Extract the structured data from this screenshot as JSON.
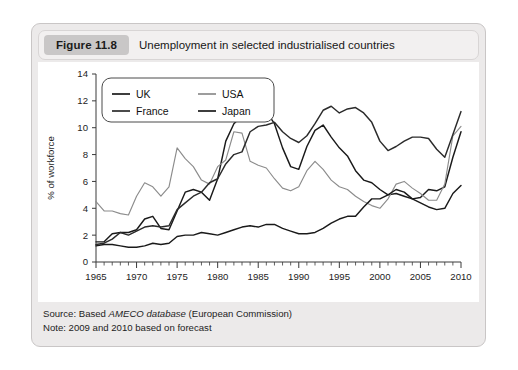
{
  "figure": {
    "badge": "Figure 11.8",
    "title": "Unemployment in selected industrialised countries"
  },
  "footer": {
    "source_prefix": "Source: Based ",
    "source_italic": "AMECO database",
    "source_suffix": " (European Commission)",
    "note": "Note: 2009 and 2010 based on forecast"
  },
  "colors": {
    "uk": "#1a1a1a",
    "usa": "#8c8c8c",
    "france": "#2b2b2b",
    "japan": "#1a1a1a",
    "axis": "#3a3a3a",
    "card_bg": "#eceaea",
    "plot_bg": "#ffffff",
    "badge_bg": "#c9c7c7"
  },
  "chart_data": {
    "type": "line",
    "title": "Unemployment in selected industrialised countries",
    "xlabel": "",
    "ylabel": "% of workforce",
    "xlim": [
      1965,
      2010
    ],
    "ylim": [
      0,
      14
    ],
    "ytick_step": 2,
    "xtick_step": 5,
    "minor_xticks": "annual",
    "grid": false,
    "legend_position": "top-left-inside",
    "yticks": [
      0,
      2,
      4,
      6,
      8,
      10,
      12,
      14
    ],
    "xticks": [
      1965,
      1970,
      1975,
      1980,
      1985,
      1990,
      1995,
      2000,
      2005,
      2010
    ],
    "x": [
      1965,
      1966,
      1967,
      1968,
      1969,
      1970,
      1971,
      1972,
      1973,
      1974,
      1975,
      1976,
      1977,
      1978,
      1979,
      1980,
      1981,
      1982,
      1983,
      1984,
      1985,
      1986,
      1987,
      1988,
      1989,
      1990,
      1991,
      1992,
      1993,
      1994,
      1995,
      1996,
      1997,
      1998,
      1999,
      2000,
      2001,
      2002,
      2003,
      2004,
      2005,
      2006,
      2007,
      2008,
      2009,
      2010
    ],
    "series": [
      {
        "name": "UK",
        "color": "#1a1a1a",
        "values": [
          1.5,
          1.5,
          2.1,
          2.2,
          2.2,
          2.4,
          3.2,
          3.4,
          2.5,
          2.4,
          3.8,
          5.2,
          5.4,
          5.2,
          4.6,
          6.2,
          9.0,
          10.3,
          10.9,
          10.9,
          11.2,
          11.2,
          10.3,
          8.5,
          7.1,
          6.9,
          8.6,
          9.8,
          10.2,
          9.3,
          8.5,
          7.9,
          6.8,
          6.1,
          5.9,
          5.4,
          5.0,
          5.1,
          4.9,
          4.7,
          4.8,
          5.4,
          5.3,
          5.6,
          7.8,
          9.7
        ]
      },
      {
        "name": "USA",
        "color": "#8c8c8c",
        "values": [
          4.5,
          3.8,
          3.8,
          3.6,
          3.5,
          4.9,
          5.9,
          5.6,
          4.9,
          5.6,
          8.5,
          7.7,
          7.1,
          6.1,
          5.8,
          7.1,
          7.6,
          9.7,
          9.6,
          7.5,
          7.2,
          7.0,
          6.2,
          5.5,
          5.3,
          5.6,
          6.8,
          7.5,
          6.9,
          6.1,
          5.6,
          5.4,
          4.9,
          4.5,
          4.2,
          4.0,
          4.7,
          5.8,
          6.0,
          5.5,
          5.1,
          4.6,
          4.6,
          5.8,
          9.4,
          10.1
        ]
      },
      {
        "name": "France",
        "color": "#2b2b2b",
        "values": [
          1.3,
          1.4,
          1.7,
          2.2,
          2.0,
          2.3,
          2.6,
          2.7,
          2.6,
          2.7,
          3.9,
          4.4,
          4.9,
          5.2,
          5.9,
          6.2,
          7.3,
          8.0,
          8.2,
          9.7,
          10.1,
          10.2,
          10.4,
          9.7,
          9.2,
          8.9,
          9.4,
          10.3,
          11.3,
          11.6,
          11.1,
          11.4,
          11.5,
          11.1,
          10.4,
          9.0,
          8.3,
          8.6,
          9.0,
          9.3,
          9.3,
          9.2,
          8.4,
          7.8,
          9.5,
          11.2
        ]
      },
      {
        "name": "Japan",
        "color": "#1a1a1a",
        "values": [
          1.2,
          1.3,
          1.3,
          1.2,
          1.1,
          1.1,
          1.2,
          1.4,
          1.3,
          1.4,
          1.9,
          2.0,
          2.0,
          2.2,
          2.1,
          2.0,
          2.2,
          2.4,
          2.6,
          2.7,
          2.6,
          2.8,
          2.8,
          2.5,
          2.3,
          2.1,
          2.1,
          2.2,
          2.5,
          2.9,
          3.2,
          3.4,
          3.4,
          4.1,
          4.7,
          4.7,
          5.0,
          5.4,
          5.2,
          4.7,
          4.4,
          4.1,
          3.9,
          4.0,
          5.1,
          5.7
        ]
      }
    ]
  },
  "legend": {
    "entries": [
      {
        "label": "UK",
        "color": "#1a1a1a"
      },
      {
        "label": "USA",
        "color": "#8c8c8c"
      },
      {
        "label": "France",
        "color": "#2b2b2b"
      },
      {
        "label": "Japan",
        "color": "#1a1a1a"
      }
    ]
  }
}
